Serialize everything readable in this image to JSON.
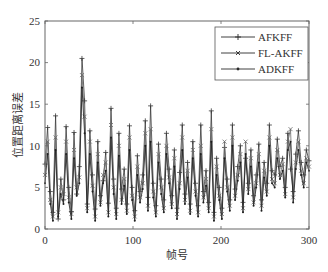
{
  "chart_data": {
    "type": "line",
    "title": "",
    "xlabel": "帧号",
    "ylabel": "位置距离误差",
    "xlim": [
      0,
      300
    ],
    "ylim": [
      0,
      25
    ],
    "xticks": [
      0,
      100,
      200,
      300
    ],
    "yticks": [
      0,
      5,
      10,
      15,
      20,
      25
    ],
    "grid": false,
    "legend_position": "upper right",
    "x": [
      0,
      3,
      6,
      9,
      12,
      15,
      18,
      21,
      24,
      27,
      30,
      33,
      36,
      39,
      42,
      45,
      48,
      51,
      54,
      57,
      60,
      63,
      66,
      69,
      72,
      75,
      78,
      81,
      84,
      87,
      90,
      93,
      96,
      99,
      102,
      105,
      108,
      111,
      114,
      117,
      120,
      123,
      126,
      129,
      132,
      135,
      138,
      141,
      144,
      147,
      150,
      153,
      156,
      159,
      162,
      165,
      168,
      171,
      174,
      177,
      180,
      183,
      186,
      189,
      192,
      195,
      198,
      201,
      204,
      207,
      210,
      213,
      216,
      219,
      222,
      225,
      228,
      231,
      234,
      237,
      240,
      243,
      246,
      249,
      252,
      255,
      258,
      261,
      264,
      267,
      270,
      273,
      276,
      279,
      282,
      285,
      288,
      291,
      294,
      297,
      300
    ],
    "series": [
      {
        "name": "AFKFF",
        "marker": "+",
        "values": [
          7.8,
          12.2,
          4.5,
          2.0,
          13.6,
          1.2,
          6.0,
          3.5,
          12.3,
          5.0,
          2.1,
          11.6,
          4.2,
          7.5,
          20.5,
          15.4,
          3.0,
          11.8,
          6.5,
          2.4,
          10.5,
          4.0,
          5.8,
          9.2,
          3.1,
          14.5,
          6.0,
          2.5,
          11.5,
          4.8,
          7.2,
          3.0,
          12.4,
          5.0,
          2.2,
          8.8,
          4.5,
          6.5,
          13.0,
          3.8,
          14.8,
          5.5,
          2.8,
          10.2,
          6.0,
          3.5,
          11.5,
          7.2,
          4.0,
          9.5,
          2.5,
          6.8,
          12.5,
          4.2,
          8.0,
          3.0,
          10.5,
          5.5,
          2.8,
          12.5,
          4.5,
          7.0,
          3.2,
          14.2,
          2.0,
          8.5,
          5.0,
          2.5,
          9.8,
          6.0,
          3.5,
          12.5,
          4.8,
          7.5,
          10.0,
          3.2,
          8.5,
          5.5,
          9.5,
          4.0,
          6.5,
          10.2,
          3.5,
          8.0,
          5.5,
          12.5,
          7.0,
          6.5,
          10.8,
          7.5,
          8.5,
          5.0,
          11.5,
          7.2,
          4.5,
          9.0,
          11.8,
          8.0,
          6.5,
          9.5,
          8.2
        ]
      },
      {
        "name": "FL-AKFF",
        "marker": "x",
        "values": [
          6.5,
          10.5,
          3.5,
          1.5,
          11.0,
          2.0,
          5.0,
          4.2,
          10.5,
          3.8,
          1.8,
          9.5,
          5.0,
          6.2,
          18.5,
          13.5,
          2.5,
          10.5,
          5.2,
          1.5,
          9.0,
          3.2,
          6.5,
          8.0,
          2.0,
          12.5,
          5.0,
          1.8,
          10.0,
          3.5,
          6.0,
          2.2,
          11.0,
          4.0,
          1.5,
          7.5,
          3.8,
          5.5,
          11.5,
          2.8,
          12.0,
          4.5,
          2.0,
          9.0,
          5.0,
          2.5,
          10.0,
          6.2,
          3.0,
          8.5,
          1.8,
          5.5,
          11.0,
          3.5,
          7.0,
          2.2,
          9.5,
          4.5,
          2.0,
          10.0,
          3.8,
          6.0,
          2.5,
          12.0,
          1.5,
          7.5,
          4.0,
          1.8,
          10.5,
          5.0,
          2.8,
          11.0,
          4.0,
          6.5,
          9.0,
          2.5,
          10.5,
          4.8,
          8.5,
          3.2,
          5.5,
          9.0,
          2.8,
          7.0,
          4.5,
          11.0,
          6.0,
          5.5,
          9.5,
          6.5,
          7.8,
          4.2,
          10.5,
          12.0,
          3.8,
          8.0,
          10.5,
          7.0,
          5.5,
          8.5,
          7.5
        ]
      },
      {
        "name": "ADKFF",
        "marker": ".",
        "values": [
          5.5,
          9.0,
          3.0,
          1.0,
          9.5,
          1.5,
          4.2,
          3.0,
          9.0,
          3.2,
          1.2,
          8.5,
          4.0,
          5.5,
          17.0,
          11.5,
          2.0,
          9.0,
          4.5,
          1.0,
          8.0,
          2.8,
          5.5,
          7.0,
          1.5,
          11.0,
          4.2,
          1.2,
          8.8,
          3.0,
          5.2,
          1.8,
          9.5,
          3.5,
          1.0,
          6.5,
          3.2,
          4.8,
          10.0,
          2.2,
          10.5,
          3.8,
          1.5,
          8.0,
          4.2,
          2.0,
          9.0,
          5.5,
          2.5,
          7.5,
          1.2,
          4.8,
          9.5,
          3.0,
          6.2,
          1.8,
          8.5,
          4.0,
          1.5,
          9.0,
          3.2,
          5.2,
          2.0,
          10.5,
          1.0,
          6.5,
          3.5,
          1.2,
          8.5,
          4.5,
          2.2,
          10.0,
          3.5,
          5.8,
          8.0,
          2.0,
          9.0,
          4.2,
          7.5,
          2.8,
          5.0,
          8.0,
          2.2,
          6.2,
          4.0,
          10.0,
          5.5,
          5.0,
          8.5,
          6.0,
          7.0,
          3.8,
          9.5,
          10.5,
          3.2,
          7.2,
          9.5,
          6.5,
          5.0,
          8.0,
          7.0
        ]
      }
    ]
  },
  "legend": {
    "items": [
      {
        "label": "AFKFF",
        "marker": "plus"
      },
      {
        "label": "FL-AKFF",
        "marker": "cross"
      },
      {
        "label": "ADKFF",
        "marker": "dot"
      }
    ]
  },
  "axes": {
    "x_tick_labels": [
      "0",
      "100",
      "200",
      "300"
    ],
    "y_tick_labels": [
      "0",
      "5",
      "10",
      "15",
      "20",
      "25"
    ],
    "xlabel": "帧号",
    "ylabel": "位置距离误差"
  },
  "colors": {
    "line": "#2a2a2a",
    "axis": "#555555",
    "text": "#333333"
  }
}
